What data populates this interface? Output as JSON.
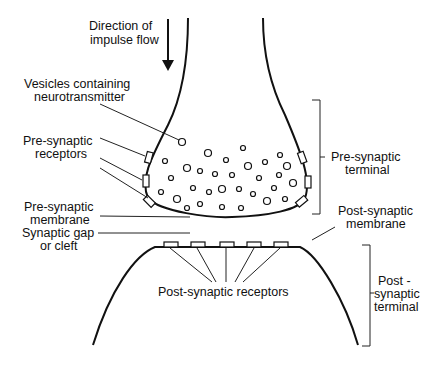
{
  "diagram": {
    "labels": {
      "direction_line1": "Direction of",
      "direction_line2": "impulse flow",
      "vesicles_line1": "Vesicles containing",
      "vesicles_line2": "neurotransmitter",
      "pre_receptors_line1": "Pre-synaptic",
      "pre_receptors_line2": "receptors",
      "pre_membrane_line1": "Pre-synaptic",
      "pre_membrane_line2": "membrane",
      "gap_line1": "Synaptic gap",
      "gap_line2": "or cleft",
      "pre_terminal_line1": "Pre-synaptic",
      "pre_terminal_line2": "terminal",
      "post_membrane_line1": "Post-synaptic",
      "post_membrane_line2": "membrane",
      "post_receptors": "Post-synaptic receptors",
      "post_terminal_line1": "Post -",
      "post_terminal_line2": "synaptic",
      "post_terminal_line3": "terminal"
    },
    "counts": {
      "pre_synaptic_receptors_left": 3,
      "pre_synaptic_receptors_right": 3,
      "post_synaptic_receptors": 5
    },
    "colors": {
      "line": "#111111",
      "background": "#ffffff"
    }
  }
}
